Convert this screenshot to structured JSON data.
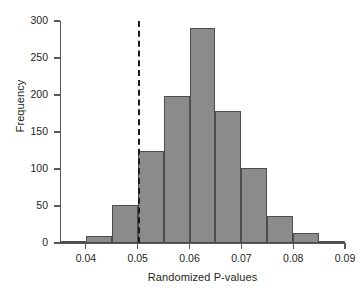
{
  "chart_data": {
    "type": "bar",
    "title": "",
    "subtitle": "",
    "xlabel": "Randomized P-values",
    "ylabel": "Frequency",
    "xlim": [
      0.035,
      0.09
    ],
    "ylim": [
      0,
      300
    ],
    "grid": false,
    "legend": null,
    "bin_width": 0.005,
    "categories": [
      "0.035",
      "0.040",
      "0.045",
      "0.050",
      "0.055",
      "0.060",
      "0.065",
      "0.070",
      "0.075",
      "0.080",
      "0.085"
    ],
    "bin_starts": [
      0.035,
      0.04,
      0.045,
      0.05,
      0.055,
      0.06,
      0.065,
      0.07,
      0.075,
      0.08,
      0.085
    ],
    "bin_ends": [
      0.04,
      0.045,
      0.05,
      0.055,
      0.06,
      0.065,
      0.07,
      0.075,
      0.08,
      0.085,
      0.09
    ],
    "values": [
      1,
      10,
      52,
      124,
      199,
      290,
      179,
      101,
      37,
      13,
      3
    ],
    "xticks": [
      0.04,
      0.05,
      0.06,
      0.07,
      0.08,
      0.09
    ],
    "xtick_labels": [
      "0.04",
      "0.05",
      "0.06",
      "0.07",
      "0.08",
      "0.09"
    ],
    "yticks": [
      0,
      50,
      100,
      150,
      200,
      250,
      300
    ],
    "ytick_labels": [
      "0",
      "50",
      "100",
      "150",
      "200",
      "250",
      "300"
    ],
    "annotations": [
      {
        "name": "significance-threshold",
        "type": "vline",
        "x": 0.05,
        "style": "dashed",
        "color": "#1a1a1a"
      }
    ],
    "colors": {
      "bar_fill": "#8b8b8b",
      "bar_stroke": "#4d4d4d",
      "axis": "#58595b",
      "text": "#231f20",
      "background": "#ffffff"
    }
  }
}
